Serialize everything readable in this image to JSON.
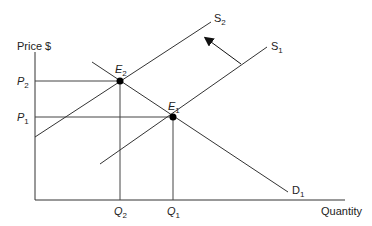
{
  "diagram": {
    "type": "supply-demand",
    "axes": {
      "y_label": "Price $",
      "x_label": "Quantity"
    },
    "curves": {
      "supply_new": {
        "label": "S",
        "sub": "2"
      },
      "supply_old": {
        "label": "S",
        "sub": "1"
      },
      "demand": {
        "label": "D",
        "sub": "1"
      }
    },
    "equilibria": {
      "e2": {
        "label": "E",
        "sub": "2"
      },
      "e1": {
        "label": "E",
        "sub": "1"
      }
    },
    "price_levels": {
      "p2": {
        "label": "P",
        "sub": "2"
      },
      "p1": {
        "label": "P",
        "sub": "1"
      }
    },
    "quantity_levels": {
      "q2": {
        "label": "Q",
        "sub": "2"
      },
      "q1": {
        "label": "Q",
        "sub": "1"
      }
    },
    "shift_arrow": "supply shifts left (S1 to S2)",
    "colors": {
      "line": "#333333",
      "point": "#000000"
    }
  }
}
